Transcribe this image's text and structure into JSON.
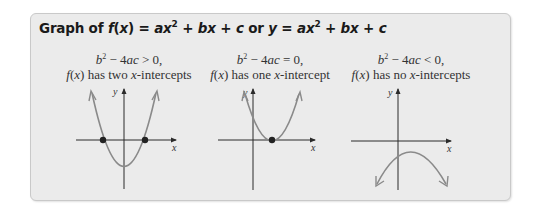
{
  "title": {
    "prefix": "Graph of ",
    "fx": "f(x)",
    "eq1": " = ax² + bx + c",
    "or": " or ",
    "y": "y",
    "eq2": " = ax² + bx + c",
    "full": "Graph of f(x) = ax² + bx + c or y = ax² + bx + c"
  },
  "panels": [
    {
      "condition": "b² − 4ac > 0,",
      "cond_lhs": "b",
      "cond_rel": " − 4ac > 0,",
      "description_fx": "f(x)",
      "description_rest": " has two ",
      "description_x": "x",
      "description_end": "-intercepts",
      "x_axis_label": "x",
      "y_axis_label": "y",
      "intercepts": 2,
      "opens": "up"
    },
    {
      "condition": "b² − 4ac = 0,",
      "cond_lhs": "b",
      "cond_rel": " − 4ac = 0,",
      "description_fx": "f(x)",
      "description_rest": " has one ",
      "description_x": "x",
      "description_end": "-intercept",
      "x_axis_label": "x",
      "y_axis_label": "y",
      "intercepts": 1,
      "opens": "up"
    },
    {
      "condition": "b² − 4ac < 0,",
      "cond_lhs": "b",
      "cond_rel": " − 4ac < 0,",
      "description_fx": "f(x)",
      "description_rest": " has no ",
      "description_x": "x",
      "description_end": "-intercepts",
      "x_axis_label": "x",
      "y_axis_label": "y",
      "intercepts": 0,
      "opens": "down"
    }
  ],
  "colors": {
    "box_bg": "#ebebeb",
    "curve": "#8a8a8a",
    "axis": "#2a2a2a",
    "point": "#222222"
  }
}
